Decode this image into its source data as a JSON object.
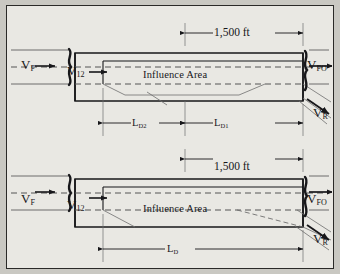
{
  "figure": {
    "type": "diagram",
    "panels": [
      {
        "id": "upper",
        "name": "two-stage-deceleration-panel",
        "dimension_top": "1,500 ft",
        "area_label": "Influence Area",
        "speed_labels": {
          "upstream": "V",
          "upstream_sub": "F",
          "segment": "V",
          "segment_sub": "12",
          "downstream": "V",
          "downstream_sub": "FO",
          "ramp": "V",
          "ramp_sub": "R"
        },
        "dimensions": [
          {
            "label": "L",
            "sub": "D2"
          },
          {
            "label": "L",
            "sub": "D1"
          }
        ]
      },
      {
        "id": "lower",
        "name": "single-stage-deceleration-panel",
        "dimension_top": "1,500 ft",
        "area_label": "Influence Area",
        "speed_labels": {
          "upstream": "V",
          "upstream_sub": "F",
          "segment": "V",
          "segment_sub": "12",
          "downstream": "V",
          "downstream_sub": "FO",
          "ramp": "V",
          "ramp_sub": "R"
        },
        "dimensions": [
          {
            "label": "L",
            "sub": "D"
          }
        ]
      }
    ],
    "colors": {
      "page_background": "#c9c8c2",
      "plate_background": "#e9e8e3",
      "plate_border": "#2a2a28",
      "ink": "#17171a",
      "thin_line": "#6e6e6e",
      "dashed_line": "#555555"
    }
  }
}
